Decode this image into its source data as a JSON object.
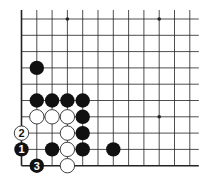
{
  "diagram": {
    "type": "go-board-corner",
    "corner": "bottom-left",
    "columns_visible": 12,
    "rows_visible": 10,
    "star_points": [
      [
        3,
        0
      ],
      [
        9,
        0
      ],
      [
        9,
        6
      ]
    ],
    "stones": [
      {
        "col": 1,
        "row": 3,
        "color": "black"
      },
      {
        "col": 1,
        "row": 5,
        "color": "black"
      },
      {
        "col": 2,
        "row": 5,
        "color": "black"
      },
      {
        "col": 3,
        "row": 5,
        "color": "black"
      },
      {
        "col": 4,
        "row": 5,
        "color": "black"
      },
      {
        "col": 1,
        "row": 6,
        "color": "white"
      },
      {
        "col": 2,
        "row": 6,
        "color": "white"
      },
      {
        "col": 3,
        "row": 6,
        "color": "white"
      },
      {
        "col": 4,
        "row": 6,
        "color": "black"
      },
      {
        "col": 0,
        "row": 7,
        "color": "white",
        "label": "2"
      },
      {
        "col": 3,
        "row": 7,
        "color": "white"
      },
      {
        "col": 4,
        "row": 7,
        "color": "black"
      },
      {
        "col": 0,
        "row": 8,
        "color": "black",
        "label": "1"
      },
      {
        "col": 2,
        "row": 8,
        "color": "black"
      },
      {
        "col": 3,
        "row": 8,
        "color": "white"
      },
      {
        "col": 4,
        "row": 8,
        "color": "black"
      },
      {
        "col": 6,
        "row": 8,
        "color": "black"
      },
      {
        "col": 1,
        "row": 9,
        "color": "black",
        "label": "3"
      },
      {
        "col": 3,
        "row": 9,
        "color": "white"
      }
    ],
    "colors": {
      "line": "#222222",
      "black_stone": "#111111",
      "white_stone": "#ffffff",
      "background": "#ffffff"
    }
  }
}
